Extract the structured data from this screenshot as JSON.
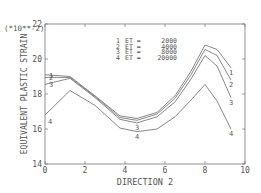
{
  "chart_data": {
    "type": "line",
    "title": "",
    "xlabel": "DIRECTION 2",
    "ylabel": "EQUIVALENT PLASTIC STRAIN",
    "y_multiplier": "(*10**-2)",
    "xlim": [
      0,
      10
    ],
    "ylim": [
      14,
      22
    ],
    "x_ticks": [
      0,
      2,
      4,
      6,
      8,
      10
    ],
    "y_ticks": [
      14,
      16,
      18,
      20,
      22
    ],
    "grid": false,
    "legend_position": "top-center",
    "x": [
      0.0,
      1.25,
      2.5,
      3.75,
      4.6,
      5.6,
      6.5,
      7.3,
      8.0,
      8.6,
      9.3
    ],
    "series": [
      {
        "name": "1",
        "label": "ET = 2000",
        "values": [
          19.1,
          19.0,
          17.9,
          16.75,
          16.6,
          16.95,
          17.9,
          19.3,
          20.8,
          20.55,
          19.5
        ]
      },
      {
        "name": "2",
        "label": "ET = 4000",
        "values": [
          18.95,
          18.95,
          17.85,
          16.65,
          16.5,
          16.85,
          17.75,
          19.1,
          20.55,
          20.2,
          18.8
        ]
      },
      {
        "name": "3",
        "label": "ET = 8000",
        "values": [
          18.55,
          18.9,
          17.8,
          16.55,
          16.35,
          16.7,
          17.55,
          18.85,
          20.2,
          19.6,
          17.8
        ]
      },
      {
        "name": "4",
        "label": "ET = 20000",
        "values": [
          16.8,
          18.2,
          17.35,
          16.05,
          15.85,
          16.0,
          16.7,
          17.65,
          18.55,
          17.6,
          16.0
        ]
      }
    ]
  },
  "legend": {
    "entries": [
      {
        "key": "1",
        "prefix": "ET =",
        "value": "2000"
      },
      {
        "key": "2",
        "prefix": "ET =",
        "value": "4000"
      },
      {
        "key": "3",
        "prefix": "ET =",
        "value": "8000"
      },
      {
        "key": "4",
        "prefix": "ET =",
        "value": "20000"
      }
    ]
  },
  "colors": {
    "axis": "#777777",
    "line": "#6a6a6a",
    "text": "#555555"
  }
}
